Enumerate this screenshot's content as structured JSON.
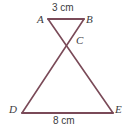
{
  "figure": {
    "name": "bowtie-triangles-diagram",
    "stroke_color": "#7a4a58",
    "label_color": "#3b3b40",
    "background_color": "#ffffff",
    "stroke_width": 1.6,
    "vertices": [
      {
        "id": "A",
        "label": "A",
        "x": 48,
        "y": 19
      },
      {
        "id": "B",
        "label": "B",
        "x": 84,
        "y": 19
      },
      {
        "id": "C",
        "label": "C",
        "x": 68,
        "y": 36
      },
      {
        "id": "D",
        "label": "D",
        "x": 22,
        "y": 113
      },
      {
        "id": "E",
        "label": "E",
        "x": 113,
        "y": 113
      }
    ],
    "segments": [
      {
        "id": "AB",
        "from": "A",
        "to": "B",
        "x1": 48,
        "y1": 19,
        "x2": 84,
        "y2": 19
      },
      {
        "id": "AE",
        "from": "A",
        "to": "E",
        "x1": 48,
        "y1": 19,
        "x2": 113,
        "y2": 113
      },
      {
        "id": "BD",
        "from": "B",
        "to": "D",
        "x1": 84,
        "y1": 19,
        "x2": 22,
        "y2": 113
      },
      {
        "id": "DE",
        "from": "D",
        "to": "E",
        "x1": 22,
        "y1": 113,
        "x2": 113,
        "y2": 113
      }
    ],
    "measurements": {
      "top_side": "3 cm",
      "bottom_side": "8 cm"
    }
  }
}
